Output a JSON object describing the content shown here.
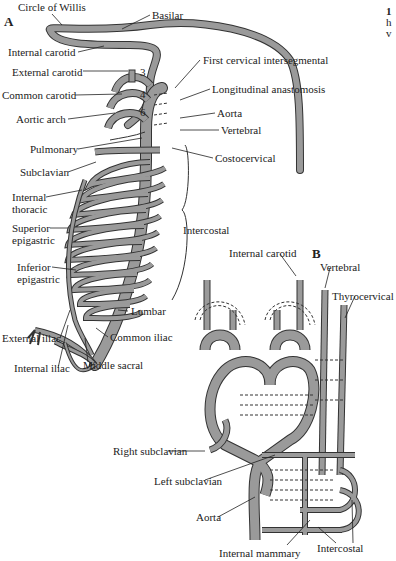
{
  "corner_text": {
    "line1": "1",
    "line2": "h",
    "line3": "v"
  },
  "panel_a": {
    "letter": "A",
    "arch_numbers": [
      "3",
      "4",
      "6"
    ],
    "labels": {
      "circle_of_willis": "Circle of Willis",
      "basilar": "Basilar",
      "internal_carotid": "Internal carotid",
      "external_carotid": "External carotid",
      "common_carotid": "Common carotid",
      "aortic_arch": "Aortic arch",
      "first_cervical_intersegmental": "First cervical intersegmental",
      "longitudinal_anastomosis": "Longitudinal anastomosis",
      "aorta": "Aorta",
      "vertebral": "Vertebral",
      "pulmonary": "Pulmonary",
      "costocervical": "Costocervical",
      "subclavian": "Subclavian",
      "internal_thoracic_1": "Internal",
      "internal_thoracic_2": "thoracic",
      "superior_epigastric_1": "Superior",
      "superior_epigastric_2": "epigastric",
      "intercostal": "Intercostal",
      "inferior_epigastric_1": "Inferior",
      "inferior_epigastric_2": "epigastric",
      "lumbar": "Lumbar",
      "external_iliac": "External iliac",
      "common_iliac": "Common iliac",
      "internal_iliac": "Internal iliac",
      "middle_sacral": "Middle sacral"
    }
  },
  "panel_b": {
    "letter": "B",
    "labels": {
      "internal_carotid": "Internal carotid",
      "vertebral": "Vertebral",
      "thyrocervical": "Thyrocervical",
      "right_subclavian": "Right subclavian",
      "left_subclavian": "Left subclavian",
      "aorta": "Aorta",
      "internal_mammary": "Internal mammary",
      "intercostal": "Intercostal"
    }
  },
  "colors": {
    "vessel_fill": "#9a9a9a",
    "vessel_outline": "#333333",
    "background": "#ffffff"
  }
}
